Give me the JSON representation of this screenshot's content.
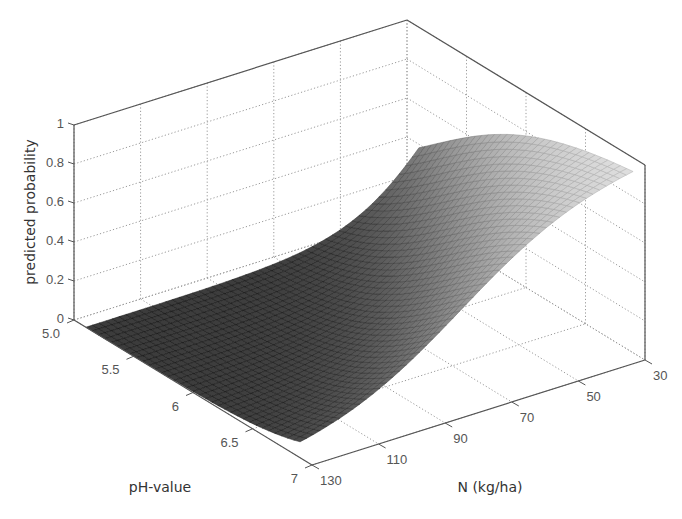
{
  "chart_data": {
    "type": "surface3d",
    "title": "",
    "xlabel": "pH-value",
    "ylabel": "N (kg/ha)",
    "zlabel": "predicted probability",
    "x_axis": {
      "name": "pH-value",
      "range": [
        5.0,
        7.0
      ],
      "ticks": [
        5.0,
        5.5,
        6.0,
        6.5,
        7.0
      ],
      "tick_labels": [
        "5.0",
        "5.5",
        "6",
        "6.5",
        "7"
      ]
    },
    "y_axis": {
      "name": "N (kg/ha)",
      "range": [
        30,
        130
      ],
      "ticks": [
        130,
        110,
        90,
        70,
        50,
        30
      ],
      "tick_labels": [
        "130",
        "110",
        "90",
        "70",
        "50",
        "30"
      ]
    },
    "z_axis": {
      "name": "predicted probability",
      "range": [
        0,
        1
      ],
      "ticks": [
        0,
        0.2,
        0.4,
        0.6,
        0.8,
        1
      ],
      "tick_labels": [
        "0",
        "0.2",
        "0.4",
        "0.6",
        "0.8",
        "1"
      ]
    },
    "grid": true,
    "colormap": "gray",
    "surface_domain": {
      "ph": [
        5.1,
        6.9
      ],
      "n": [
        30,
        130
      ]
    },
    "grid_ph": [
      5.0,
      5.5,
      6.0,
      6.5,
      7.0
    ],
    "grid_n": [
      30,
      50,
      70,
      90,
      110,
      130
    ],
    "z_values": [
      [
        0.33,
        0.09,
        0.02,
        0.0,
        0.0,
        0.0
      ],
      [
        0.58,
        0.25,
        0.07,
        0.02,
        0.0,
        0.0
      ],
      [
        0.78,
        0.49,
        0.21,
        0.07,
        0.02,
        0.01
      ],
      [
        0.88,
        0.71,
        0.45,
        0.21,
        0.08,
        0.03
      ],
      [
        0.94,
        0.85,
        0.68,
        0.45,
        0.24,
        0.11
      ]
    ],
    "model": {
      "form": "logistic",
      "a0": -0.7,
      "a1": 2.2,
      "a2": -0.25,
      "b0": 0.08,
      "b1": -0.0158
    }
  },
  "labels": {
    "x": "pH-value",
    "y": "N (kg/ha)",
    "z": "predicted probability"
  }
}
